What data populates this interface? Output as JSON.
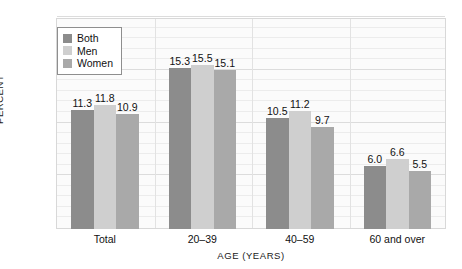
{
  "chart_data": {
    "type": "bar",
    "title": "",
    "subtitle": "",
    "xlabel": "AGE (YEARS)",
    "ylabel": "PERCENT",
    "categories": [
      "Total",
      "20–39",
      "40–59",
      "60 and over"
    ],
    "series": [
      {
        "name": "Both",
        "color": "#8c8c8c",
        "values": [
          11.3,
          15.3,
          10.5,
          6.0
        ],
        "labels": [
          "11.3",
          "15.3",
          "10.5",
          "6.0"
        ]
      },
      {
        "name": "Men",
        "color": "#cfcfcf",
        "values": [
          11.8,
          15.5,
          11.2,
          6.6
        ],
        "labels": [
          "11.8",
          "15.5",
          "11.2",
          "6.6"
        ]
      },
      {
        "name": "Women",
        "color": "#a9a9a9",
        "values": [
          10.9,
          15.1,
          9.7,
          5.5
        ],
        "labels": [
          "10.9",
          "15.1",
          "9.7",
          "5.5"
        ]
      }
    ],
    "ylim": [
      0,
      20
    ],
    "yticks": [
      0,
      5,
      10,
      15,
      20
    ],
    "ytick_labels": [
      "0",
      "5",
      "10",
      "15",
      "20"
    ],
    "minor_gridline_step": 1,
    "grid": true,
    "legend_position": "top-left-inside",
    "legend_entries": [
      "Both",
      "Men",
      "Women"
    ],
    "group_separators": true,
    "plot_background": "#fbfbfb",
    "frame_color": "#d8d8d8"
  }
}
